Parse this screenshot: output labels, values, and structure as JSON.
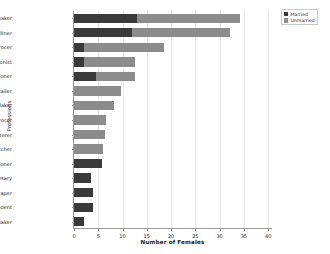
{
  "chart_data": {
    "type": "bar",
    "orientation": "horizontal",
    "stacked": true,
    "title": "",
    "xlabel": "Number of Females",
    "ylabel": "Professions",
    "xlim": [
      0,
      41
    ],
    "ylim_categories": 15,
    "grid": "vertical",
    "xticks": [
      0,
      5,
      10,
      15,
      20,
      25,
      30,
      35,
      40
    ],
    "xticklabels": [
      "0",
      "5",
      "10",
      "15",
      "20",
      "25",
      "30",
      "35",
      "40"
    ],
    "categories": [
      "Dressmaker",
      "Milliner",
      "Grocer",
      "Tobacconist",
      "Confectioner",
      "Beer Retailer",
      "Baker",
      "Greengrocer",
      "Fruiterer",
      "Butcher",
      "Stationer",
      "Secretary",
      "Linendraper",
      "Lady Superintendent",
      "Staymaker"
    ],
    "series": [
      {
        "name": "Married",
        "color": "#3a3a3a",
        "values": [
          13,
          12,
          2,
          2,
          4.5,
          0,
          0,
          0,
          0,
          0,
          5.7,
          3.5,
          4,
          4,
          2
        ]
      },
      {
        "name": "Unmarried",
        "color": "#8c8c8c",
        "values": [
          21.2,
          20.1,
          16.6,
          10.5,
          8,
          9.7,
          8.2,
          6.6,
          6.4,
          6,
          0,
          0,
          0,
          0,
          0
        ]
      }
    ],
    "totals": [
      34.2,
      32.1,
      18.6,
      12.5,
      12.5,
      9.7,
      8.2,
      6.6,
      6.4,
      6,
      5.7,
      3.5,
      4,
      4,
      2
    ],
    "legend": {
      "position": "upper right",
      "entries": [
        "Married",
        "Unmarried"
      ]
    }
  }
}
